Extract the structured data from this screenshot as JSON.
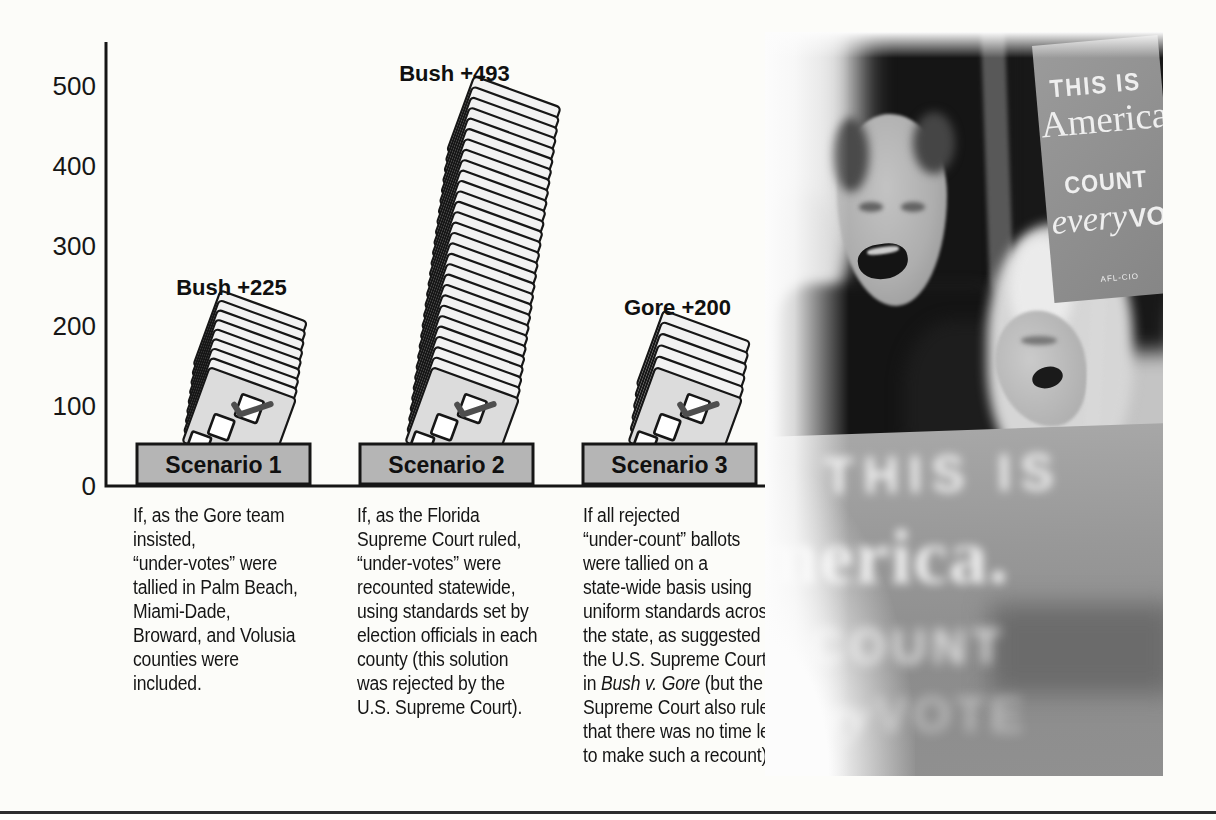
{
  "colors": {
    "page_bg": "#fcfcf9",
    "ink": "#161616",
    "pedestal_fill": "#b5b5b5",
    "sheet_fill": "#f2f2f2",
    "front_sheet_fill": "#dcdcdc",
    "checkmark": "#4e4e4e"
  },
  "chart_data": {
    "type": "bar",
    "title": "",
    "xlabel": "",
    "ylabel": "",
    "ylim": [
      0,
      500
    ],
    "yticks": [
      0,
      100,
      200,
      300,
      400,
      500
    ],
    "grid": false,
    "categories": [
      "Scenario 1",
      "Scenario 2",
      "Scenario 3"
    ],
    "values": [
      225,
      493,
      200
    ],
    "bar_style": "stack of ballot sheets with checked checkbox, inserted into gray pedestal slot",
    "series": [
      {
        "scenario": "Scenario 1",
        "result_label": "Bush +225",
        "winner": "Bush",
        "margin": 225,
        "sheets": 9
      },
      {
        "scenario": "Scenario 2",
        "result_label": "Bush +493",
        "winner": "Bush",
        "margin": 493,
        "sheets": 29
      },
      {
        "scenario": "Scenario 3",
        "result_label": "Gore +200",
        "winner": "Gore",
        "margin": 200,
        "sheets": 6
      }
    ],
    "captions": [
      {
        "pre": "If, as the Gore team\ninsisted,\n“under-votes” were\ntallied in Palm Beach,\nMiami-Dade,\nBroward, and Volusia\ncounties were\nincluded.",
        "italic": "",
        "post": ""
      },
      {
        "pre": "If, as the Florida\nSupreme Court ruled,\n“under-votes” were\nrecounted statewide,\nusing standards set by\nelection officials in each\ncounty (this solution\nwas rejected by the\nU.S. Supreme Court).",
        "italic": "",
        "post": ""
      },
      {
        "pre": "If all rejected\n“under-count” ballots\nwere tallied on a\nstate-wide basis using\nuniform standards across\nthe state, as suggested by\nthe U.S. Supreme Court\nin ",
        "italic": "Bush v. Gore",
        "post": " (but the\nSupreme Court also ruled\nthat there was no time left\nto make such a recount)."
      }
    ]
  },
  "photo": {
    "alt": "Black-and-white photograph of shouting protesters holding Count Every Vote signs",
    "top_sign": {
      "line1": "THIS IS",
      "line2": "America",
      "line3": "COUNT",
      "line4a": "every",
      "line4b": "VOTE",
      "footer": "AFL-CIO"
    },
    "front_sign": {
      "line1": "THIS IS",
      "line2": "merica.",
      "line3": "COUNT",
      "line4a": "ery",
      "line4b": "VOTE"
    }
  }
}
